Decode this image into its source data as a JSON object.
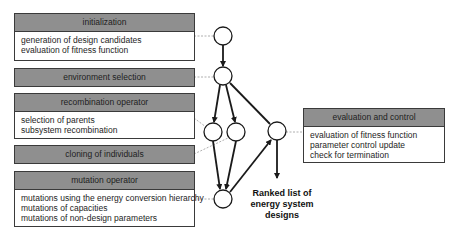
{
  "boxes": {
    "initialization": {
      "title": "initialization",
      "items": [
        "generation of design candidates",
        "evaluation of fitness function"
      ]
    },
    "environment_selection": {
      "title": "environment selection"
    },
    "recombination": {
      "title": "recombination operator",
      "items": [
        "selection of parents",
        "subsystem recombination"
      ]
    },
    "cloning": {
      "title": "cloning of individuals"
    },
    "mutation": {
      "title": "mutation operator",
      "items": [
        "mutations using the energy conversion hierarchy",
        "mutations of capacities",
        "mutations of non-design parameters"
      ]
    },
    "evaluation": {
      "title": "evaluation and control",
      "items": [
        "evaluation of fitness function",
        "parameter control update",
        "check for termination"
      ]
    }
  },
  "result": {
    "lines": [
      "Ranked list of",
      "energy system",
      "designs"
    ]
  },
  "colors": {
    "header_fill": "#8f8f8f",
    "border": "#3a3a3a",
    "arrow": "#1a1a1a",
    "connector": "#9a9a9a"
  }
}
